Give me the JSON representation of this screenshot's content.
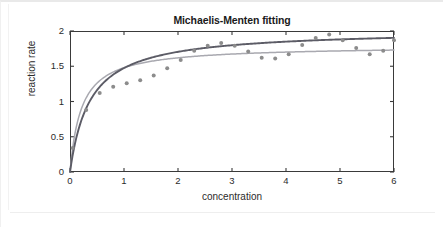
{
  "chart_data": {
    "type": "scatter",
    "title": "Michaelis-Menten fitting",
    "xlabel": "concentration",
    "ylabel": "reaction rate",
    "xlim": [
      0,
      6
    ],
    "ylim": [
      0,
      2
    ],
    "xticks": [
      0,
      1,
      2,
      3,
      4,
      5,
      6
    ],
    "yticks": [
      0,
      0.5,
      1,
      1.5,
      2
    ],
    "xtick_labels": [
      "0",
      "1",
      "2",
      "3",
      "4",
      "5",
      "6"
    ],
    "ytick_labels": [
      "0",
      "0.5",
      "1",
      "1.5",
      "2"
    ],
    "grid": false,
    "legend": "none",
    "point_color": "#8c8c8c",
    "points": {
      "x": [
        0.05,
        0.3,
        0.55,
        0.8,
        1.05,
        1.3,
        1.55,
        1.8,
        2.05,
        2.3,
        2.55,
        2.8,
        3.05,
        3.3,
        3.55,
        3.8,
        4.05,
        4.3,
        4.55,
        4.8,
        5.05,
        5.3,
        5.55,
        5.8,
        6.0
      ],
      "y": [
        0.34,
        0.88,
        1.12,
        1.21,
        1.26,
        1.3,
        1.37,
        1.47,
        1.59,
        1.72,
        1.79,
        1.83,
        1.79,
        1.71,
        1.62,
        1.61,
        1.67,
        1.8,
        1.9,
        1.95,
        1.87,
        1.76,
        1.67,
        1.72,
        1.87
      ]
    },
    "series": [
      {
        "name": "fit-curve-dark",
        "type": "line",
        "color": "#5c5c66",
        "model": "michaelis-menten",
        "vmax": 2.02,
        "km": 0.37,
        "curve_x": [
          0,
          0.1,
          0.2,
          0.3,
          0.4,
          0.5,
          0.6,
          0.8,
          1.0,
          1.2,
          1.4,
          1.6,
          1.8,
          2.0,
          2.25,
          2.5,
          2.75,
          3.0,
          3.25,
          3.5,
          3.75,
          4.0,
          4.25,
          4.5,
          4.75,
          5.0,
          5.25,
          5.5,
          5.75,
          6.0
        ],
        "curve_y": [
          0.0,
          0.43,
          0.71,
          0.9,
          1.05,
          1.16,
          1.25,
          1.38,
          1.48,
          1.55,
          1.6,
          1.64,
          1.68,
          1.71,
          1.73,
          1.76,
          1.78,
          1.8,
          1.81,
          1.83,
          1.84,
          1.85,
          1.86,
          1.87,
          1.87,
          1.88,
          1.89,
          1.89,
          1.9,
          1.9
        ]
      },
      {
        "name": "fit-curve-light",
        "type": "line",
        "color": "#a9a9b0",
        "model": "michaelis-menten",
        "vmax": 1.79,
        "km": 0.21,
        "curve_x": [
          0,
          0.1,
          0.2,
          0.3,
          0.4,
          0.5,
          0.6,
          0.8,
          1.0,
          1.2,
          1.4,
          1.6,
          1.8,
          2.0,
          2.25,
          2.5,
          2.75,
          3.0,
          3.25,
          3.5,
          3.75,
          4.0,
          4.25,
          4.5,
          4.75,
          5.0,
          5.25,
          5.5,
          5.75,
          6.0
        ],
        "curve_y": [
          0.0,
          0.58,
          0.87,
          1.05,
          1.17,
          1.26,
          1.32,
          1.42,
          1.48,
          1.52,
          1.55,
          1.58,
          1.6,
          1.62,
          1.64,
          1.65,
          1.66,
          1.67,
          1.68,
          1.68,
          1.69,
          1.7,
          1.7,
          1.71,
          1.71,
          1.72,
          1.72,
          1.72,
          1.73,
          1.73
        ]
      }
    ]
  }
}
